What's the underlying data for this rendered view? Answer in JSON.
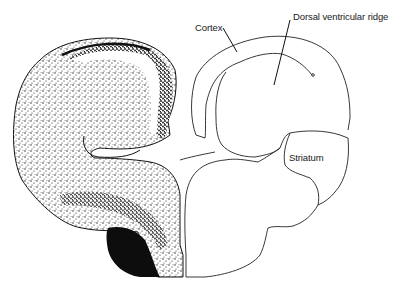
{
  "figure": {
    "type": "brain-section-diagram",
    "panels": [
      {
        "side": "left",
        "style": "stippled-histology",
        "description": "Stained coronal hemisphere section"
      },
      {
        "side": "right",
        "style": "line-drawing",
        "description": "Outline schematic of hemisphere"
      }
    ],
    "labels": {
      "cortex": "Cortex",
      "dvr": "Dorsal ventricular ridge",
      "striatum": "Striatum"
    },
    "colors": {
      "ink": "#111111",
      "background": "#ffffff"
    }
  }
}
